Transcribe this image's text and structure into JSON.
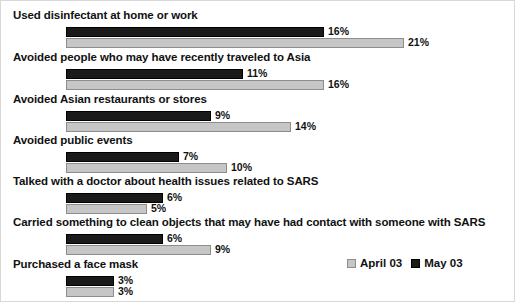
{
  "chart_data": {
    "type": "bar",
    "orientation": "horizontal",
    "title": "",
    "xlabel": "",
    "ylabel": "",
    "grid": false,
    "xlim": [
      0,
      25
    ],
    "legend_position": "bottom-right",
    "categories": [
      "Used disinfectant at home or work",
      "Avoided people who may have recently traveled to Asia",
      "Avoided Asian restaurants or stores",
      "Avoided public events",
      "Talked with a doctor about health issues related to SARS",
      "Carried something to clean objects that may have had contact with someone with SARS",
      "Purchased a face mask"
    ],
    "series": [
      {
        "name": "May 03",
        "color": "#1a1a1a",
        "values": [
          16,
          11,
          9,
          7,
          6,
          6,
          3
        ],
        "labels": [
          "16%",
          "11%",
          "9%",
          "7%",
          "6%",
          "6%",
          "3%"
        ]
      },
      {
        "name": "April 03",
        "color": "#c6c6c6",
        "values": [
          21,
          16,
          14,
          10,
          5,
          9,
          3
        ],
        "labels": [
          "21%",
          "16%",
          "14%",
          "10%",
          "5%",
          "9%",
          "3%"
        ]
      }
    ]
  },
  "legend": {
    "entries": [
      {
        "label": "April 03",
        "swatch": "april"
      },
      {
        "label": "May 03",
        "swatch": "may"
      }
    ]
  }
}
